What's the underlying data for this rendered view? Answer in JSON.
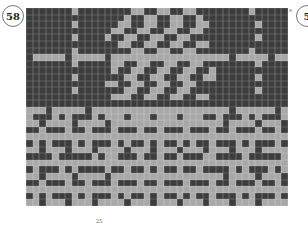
{
  "chart_number_left": "58",
  "chart_number_right": "5",
  "corner_mark": "R",
  "page_number": "25",
  "colors": {
    "dark": "#3d3d3d",
    "light": "#a8a8a8"
  },
  "grid": {
    "columns": 40,
    "rows": [
      "dddddddlddddddddllddllddllddddddddlddddd",
      "dddddddddddddddlddllddllddlddddddddddddd",
      "dddddddlddddddllddllddllddlldddddddlddddd",
      "dddddddddddddllddllddllddlldddddddddddddd",
      "dddddddlddddlddllddllddllddddddddddlddddd",
      "ddddddddddddddllddllddllddllddddddddddddd",
      "dddddddlddddddddllddllddllddddddddlddddd",
      "dllllldllllldlllllllllllllllllldllllldllll",
      "dddddddldddddllddllddllddllddddddddlddddd",
      "dddddddddddddlddllddllddllddlddddddddddddd",
      "dddddddldddddddllddllddllddllddddddlddddd",
      "ddddddddddddllddllddllddllddddddddddddddd",
      "dddddddldddddddllddllddllddddddddddlddddd",
      "dddddddddddddlllddllddllddllddddddddddddd",
      "ddddddddddddddddddddddddddddddddddddddddd",
      "llldllllldllllllllllllllllllllldlllllldll",
      "ldddldldddldllldllldllldlllddldddldldddld",
      "lldlllldlllldllllllllllllllllldlllldllldl",
      "ddldddlddldddldddlddldddldddlddldddlddldd",
      "lllllllllllllllllllllllllllllllllllllllll",
      "dldldddldldddldlddldlddldlddldddldldddldl",
      "lldllldllldlllldllldllldllldllldllldlllld",
      "ddddldddddldlldddlddlddldddllddddldddddld",
      "lllllllllllllllllllllllllllllllllllllllll",
      "dldddldlddddlddlddldlddlddlddddldldddldld",
      "lldlllldlllldllllllllllllllllldlllldllldl",
      "ddldddlddldddldddlddldddldddlddldddlddldd",
      "lllllllllllllllllllllllllllllllllllllllll",
      "dldldddldldddldlddldlddldlddldddldldddldl",
      "lldllldllldlllldllldllldllldllldllldlllld"
    ]
  }
}
